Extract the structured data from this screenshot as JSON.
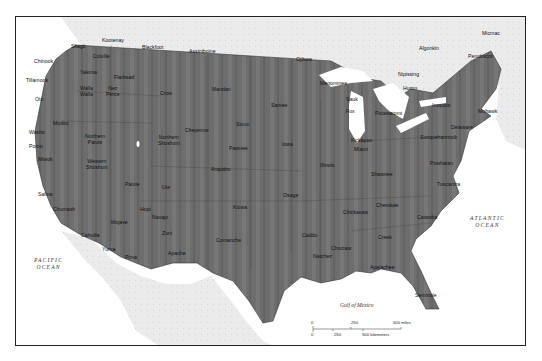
{
  "map": {
    "title": "Native American tribes of the United States",
    "water_labels": {
      "pacific": [
        "PACIFIC",
        "OCEAN"
      ],
      "atlantic": [
        "ATLANTIC",
        "OCEAN"
      ],
      "gulf": "Gulf of Mexico"
    },
    "scale": {
      "miles_ticks": [
        "0",
        "250",
        "500 miles"
      ],
      "km_ticks": [
        "0",
        "250",
        "500 kilometers"
      ]
    },
    "colors": {
      "land_us": "#6e6e6e",
      "land_other": "#e6e6e6",
      "water": "#ffffff",
      "frame": "#222222"
    },
    "tribes": [
      {
        "name": "Kootenay",
        "x": 112,
        "y": 41
      },
      {
        "name": "Blackfoot",
        "x": 152,
        "y": 48
      },
      {
        "name": "Assiniboine",
        "x": 199,
        "y": 52
      },
      {
        "name": "Skagit",
        "x": 81,
        "y": 47
      },
      {
        "name": "Chinook",
        "x": 44,
        "y": 62
      },
      {
        "name": "Colville",
        "x": 103,
        "y": 57
      },
      {
        "name": "Tillamook",
        "x": 36,
        "y": 81
      },
      {
        "name": "Yakima",
        "x": 90,
        "y": 73
      },
      {
        "name": "Flathead",
        "x": 124,
        "y": 78
      },
      {
        "name": "Walla Walla",
        "x": 90,
        "y": 89,
        "two": true
      },
      {
        "name": "Nez Perce",
        "x": 116,
        "y": 89,
        "two": true
      },
      {
        "name": "Crow",
        "x": 170,
        "y": 94
      },
      {
        "name": "Mandan",
        "x": 222,
        "y": 90
      },
      {
        "name": "Ojibwa",
        "x": 306,
        "y": 60
      },
      {
        "name": "Algonkin",
        "x": 429,
        "y": 49
      },
      {
        "name": "Micmac",
        "x": 492,
        "y": 34
      },
      {
        "name": "Penobscot",
        "x": 478,
        "y": 57
      },
      {
        "name": "Nipissing",
        "x": 408,
        "y": 75
      },
      {
        "name": "Huron",
        "x": 413,
        "y": 89
      },
      {
        "name": "Menominee",
        "x": 330,
        "y": 84
      },
      {
        "name": "Sauk",
        "x": 356,
        "y": 100
      },
      {
        "name": "Fox",
        "x": 356,
        "y": 112
      },
      {
        "name": "Santee",
        "x": 281,
        "y": 106
      },
      {
        "name": "Potawatomi",
        "x": 385,
        "y": 114
      },
      {
        "name": "Iroquois",
        "x": 442,
        "y": 106
      },
      {
        "name": "Mohawk",
        "x": 488,
        "y": 112
      },
      {
        "name": "Delaware",
        "x": 461,
        "y": 128
      },
      {
        "name": "Susquehannock",
        "x": 430,
        "y": 138
      },
      {
        "name": "Kickapoo",
        "x": 361,
        "y": 141
      },
      {
        "name": "Miami",
        "x": 364,
        "y": 150
      },
      {
        "name": "Powhatan",
        "x": 440,
        "y": 164
      },
      {
        "name": "Illinois",
        "x": 330,
        "y": 166
      },
      {
        "name": "Shawnee",
        "x": 381,
        "y": 175
      },
      {
        "name": "Tuscarora",
        "x": 447,
        "y": 185
      },
      {
        "name": "Oto",
        "x": 45,
        "y": 100
      },
      {
        "name": "Modoc",
        "x": 63,
        "y": 124
      },
      {
        "name": "Washo",
        "x": 39,
        "y": 133
      },
      {
        "name": "Nez Perce Tribe",
        "hidden": true
      },
      {
        "name": "Northern Paiute",
        "x": 95,
        "y": 137,
        "two": true
      },
      {
        "name": "Pomo",
        "x": 39,
        "y": 147
      },
      {
        "name": "Miwok",
        "x": 48,
        "y": 160
      },
      {
        "name": "Western Shoshoni",
        "x": 96,
        "y": 162,
        "two": true
      },
      {
        "name": "Northern Shoshoni",
        "x": 168,
        "y": 138,
        "two": true
      },
      {
        "name": "Cheyenne",
        "x": 195,
        "y": 131
      },
      {
        "name": "Sioux",
        "x": 246,
        "y": 125
      },
      {
        "name": "Pawnee",
        "x": 239,
        "y": 149
      },
      {
        "name": "Iowa",
        "x": 292,
        "y": 145
      },
      {
        "name": "Arapaho",
        "x": 221,
        "y": 170
      },
      {
        "name": "Paiute",
        "x": 135,
        "y": 185
      },
      {
        "name": "Ute",
        "x": 172,
        "y": 188
      },
      {
        "name": "Salina",
        "x": 48,
        "y": 195
      },
      {
        "name": "Chumash",
        "x": 63,
        "y": 210
      },
      {
        "name": "Hopi",
        "x": 150,
        "y": 210
      },
      {
        "name": "Navajo",
        "x": 162,
        "y": 218
      },
      {
        "name": "Mojave",
        "x": 121,
        "y": 223
      },
      {
        "name": "Zuni",
        "x": 172,
        "y": 234
      },
      {
        "name": "Osage",
        "x": 293,
        "y": 196
      },
      {
        "name": "Kiowa",
        "x": 243,
        "y": 208
      },
      {
        "name": "Chickasaw",
        "x": 353,
        "y": 213
      },
      {
        "name": "Cherokee",
        "x": 386,
        "y": 206
      },
      {
        "name": "Catawba",
        "x": 427,
        "y": 218
      },
      {
        "name": "Cahuilla",
        "x": 91,
        "y": 236
      },
      {
        "name": "Comanche",
        "x": 226,
        "y": 241
      },
      {
        "name": "Caddo",
        "x": 312,
        "y": 236
      },
      {
        "name": "Creek",
        "x": 388,
        "y": 238
      },
      {
        "name": "Choctaw",
        "x": 341,
        "y": 249
      },
      {
        "name": "Natchez",
        "x": 323,
        "y": 257
      },
      {
        "name": "Apache",
        "x": 178,
        "y": 254
      },
      {
        "name": "Pima",
        "x": 135,
        "y": 258
      },
      {
        "name": "Yuma",
        "x": 112,
        "y": 250
      },
      {
        "name": "Apalachee",
        "x": 380,
        "y": 268
      },
      {
        "name": "Seminole",
        "x": 425,
        "y": 296
      }
    ]
  }
}
